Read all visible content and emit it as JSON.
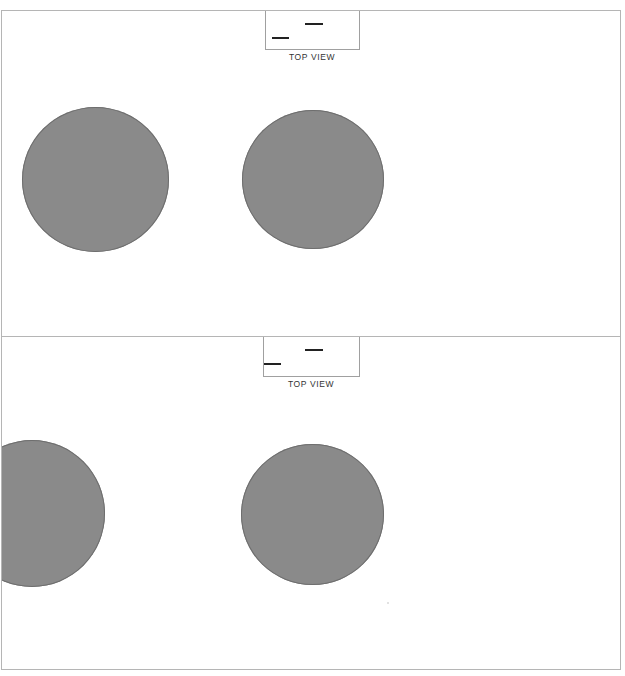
{
  "caption_fragment": "",
  "views": [
    {
      "label": "TOP VIEW",
      "circles": [
        {
          "cx": 94,
          "cy": 169,
          "r": 73
        },
        {
          "cx": 312,
          "cy": 169,
          "r": 71
        }
      ]
    },
    {
      "label": "TOP VIEW",
      "circles": [
        {
          "cx": 30,
          "cy": 177,
          "r": 73
        },
        {
          "cx": 311,
          "cy": 177,
          "r": 71
        }
      ]
    }
  ],
  "colors": {
    "disc_fill": "#8a8a8a",
    "frame_border": "#b5b5b5",
    "marker_line": "#222222"
  }
}
